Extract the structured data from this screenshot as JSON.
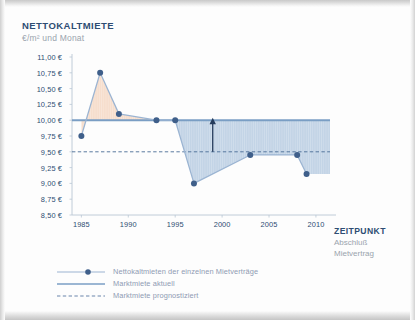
{
  "title": "NETTOKALTMIETE",
  "subtitle": "€/m² und Monat",
  "xaxis_title": "ZEITPUNKT",
  "xaxis_sub1": "Abschluß",
  "xaxis_sub2": "Mietvertrag",
  "colors": {
    "navy": "#2e4d73",
    "point": "#3f5f8a",
    "market_line": "#7a9ec4",
    "fill_blue": "#b9cde2",
    "fill_orange": "#f5d9c4",
    "gray_text": "#9aa4ad",
    "legend_text": "#8f9bb3",
    "axis": "#b9c6d4"
  },
  "legend": {
    "items": [
      {
        "label": "Nettokaltmieten der einzelnen Mietverträge",
        "style": "line-with-marker"
      },
      {
        "label": "Marktmiete aktuell",
        "style": "solid-line"
      },
      {
        "label": "Marktmiete prognostiziert",
        "style": "dashed-line"
      }
    ]
  },
  "chart_data": {
    "type": "line",
    "title": "NETTOKALTMIETE",
    "subtitle": "€/m² und Monat",
    "xlabel": "ZEITPUNKT Abschluß Mietvertrag",
    "ylabel": "€/m² und Monat",
    "xlim": [
      1984,
      2011.5
    ],
    "ylim": [
      8.5,
      11.0
    ],
    "grid": false,
    "legend_position": "bottom-left",
    "ytick_labels": [
      "11,00 €",
      "10,75 €",
      "10,50 €",
      "10,25 €",
      "10,00 €",
      "9,75 €",
      "9,50 €",
      "9,25 €",
      "9,00 €",
      "8,75 €",
      "8,50 €"
    ],
    "ytick_values": [
      11.0,
      10.75,
      10.5,
      10.25,
      10.0,
      9.75,
      9.5,
      9.25,
      9.0,
      8.75,
      8.5
    ],
    "xtick_labels": [
      "1985",
      "1990",
      "1995",
      "2000",
      "2005",
      "2010"
    ],
    "xtick_values": [
      1985,
      1990,
      1995,
      2000,
      2005,
      2010
    ],
    "series": [
      {
        "name": "Nettokaltmieten der einzelnen Mietverträge",
        "type": "line-markers",
        "x": [
          1985,
          1987,
          1989,
          1993,
          1995,
          1997,
          2003,
          2008,
          2009
        ],
        "values": [
          9.75,
          10.75,
          10.1,
          10.0,
          10.0,
          9.0,
          9.45,
          9.45,
          9.15
        ]
      },
      {
        "name": "Marktmiete aktuell",
        "type": "horizontal-line",
        "value": 10.0,
        "x_start": 1984,
        "x_end": 2011.5
      },
      {
        "name": "Marktmiete prognostiziert",
        "type": "horizontal-dashed-line",
        "value": 9.5,
        "x_start": 1984,
        "x_end": 2011.5
      }
    ],
    "fills": [
      {
        "name": "above-market-orange",
        "x_start": 1985,
        "x_end": 1993,
        "color": "#f5d9c4"
      },
      {
        "name": "below-market-blue",
        "x_start": 1995,
        "x_end": 2011.5,
        "color": "#b9cde2"
      }
    ],
    "annotations": [
      {
        "type": "arrow-up",
        "x": 1999,
        "y_from": 9.5,
        "y_to": 10.0
      }
    ]
  }
}
